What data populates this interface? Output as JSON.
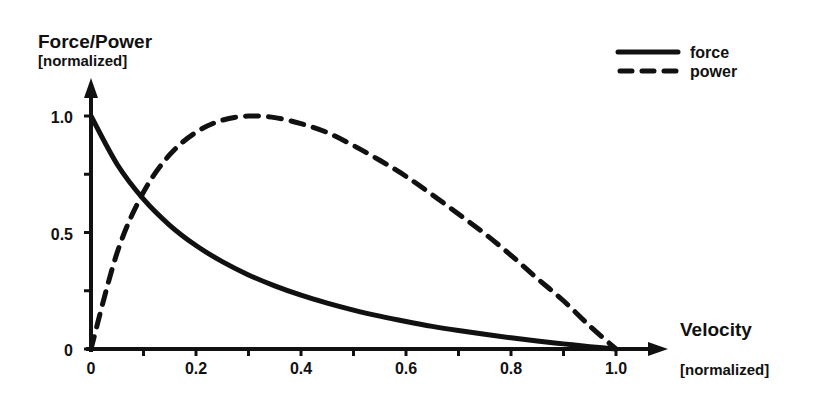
{
  "chart_data": {
    "type": "line",
    "title": "",
    "ylabel": "Force/Power",
    "ylabel_unit": "[normalized]",
    "xlabel": "Velocity",
    "xlabel_unit": "[normalized]",
    "xlim": [
      0,
      1.0
    ],
    "ylim": [
      0,
      1.0
    ],
    "x_ticks": [
      "0",
      "0.2",
      "0.4",
      "0.6",
      "0.8",
      "1.0"
    ],
    "y_ticks": [
      "0",
      "0.5",
      "1.0"
    ],
    "grid": false,
    "legend_position": "top-right",
    "x": [
      0,
      0.05,
      0.1,
      0.15,
      0.2,
      0.25,
      0.3,
      0.35,
      0.4,
      0.45,
      0.5,
      0.55,
      0.6,
      0.65,
      0.7,
      0.75,
      0.8,
      0.85,
      0.9,
      0.95,
      1.0
    ],
    "series": [
      {
        "name": "force",
        "style": "solid",
        "values": [
          1,
          0.792,
          0.643,
          0.531,
          0.444,
          0.375,
          0.318,
          0.271,
          0.231,
          0.197,
          0.167,
          0.141,
          0.118,
          0.097,
          0.079,
          0.063,
          0.048,
          0.034,
          0.022,
          0.01,
          0
        ]
      },
      {
        "name": "power",
        "style": "dashed",
        "values": [
          0,
          0.415,
          0.673,
          0.834,
          0.93,
          0.982,
          1.0,
          0.993,
          0.967,
          0.929,
          0.873,
          0.81,
          0.741,
          0.662,
          0.579,
          0.495,
          0.402,
          0.303,
          0.207,
          0.099,
          0
        ]
      }
    ]
  },
  "labels": {
    "y_title": "Force/Power",
    "y_unit": "[normalized]",
    "x_title": "Velocity",
    "x_unit": "[normalized]",
    "legend_force": "force",
    "legend_power": "power",
    "xt0": "0",
    "xt1": "0.2",
    "xt2": "0.4",
    "xt3": "0.6",
    "xt4": "0.8",
    "xt5": "1.0",
    "yt0": "0",
    "yt1": "0.5",
    "yt2": "1.0"
  }
}
